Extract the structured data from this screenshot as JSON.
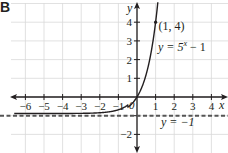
{
  "panel_label": "B",
  "chart_data": {
    "type": "line",
    "title": "",
    "xlabel": "x",
    "ylabel": "y",
    "xlim": [
      -6.5,
      4.7
    ],
    "ylim": [
      -2.6,
      5.1
    ],
    "grid": true,
    "x_ticks": [
      -6,
      -5,
      -4,
      -3,
      -2,
      -1,
      1,
      2,
      3,
      4
    ],
    "x_tick_labels": [
      "−6",
      "−5",
      "−4",
      "−3",
      "−2",
      "−1",
      "1",
      "2",
      "3",
      "4"
    ],
    "y_ticks": [
      -2,
      -1,
      1,
      2,
      3,
      4
    ],
    "y_tick_labels": [
      "−2",
      "",
      "1",
      "2",
      "3",
      "4"
    ],
    "origin_label": "0",
    "series": [
      {
        "name": "y = 5^x − 1",
        "function": "5^x - 1",
        "style": "solid",
        "x": [
          -6.5,
          -6,
          -5,
          -4,
          -3,
          -2,
          -1,
          -0.5,
          0,
          0.5,
          1,
          1.1
        ],
        "y": [
          -1.0,
          -1.0,
          -0.9997,
          -0.9984,
          -0.992,
          -0.96,
          -0.8,
          -0.553,
          0,
          1.236,
          4,
          4.875
        ]
      },
      {
        "name": "y = −1",
        "function": "-1",
        "style": "dashed",
        "x": [
          -6.5,
          4.7
        ],
        "y": [
          -1,
          -1
        ]
      }
    ],
    "annotations": [
      {
        "text": "(1, 4)",
        "x": 1,
        "y": 4,
        "type": "point"
      },
      {
        "text": "y = 5",
        "superscript": "x",
        "suffix": " − 1",
        "label_for": "curve"
      },
      {
        "text": "y = −1",
        "label_for": "asymptote"
      }
    ],
    "colors": {
      "grid": "#d9d9d9",
      "axis": "#231f20",
      "curve": "#231f20",
      "asymptote": "#555555"
    }
  },
  "labels": {
    "point": "(1, 4)",
    "curve_prefix": "y = 5",
    "curve_sup": "x",
    "curve_suffix": " − 1",
    "asymptote": "y = −1",
    "x_axis": "x",
    "y_axis": "y",
    "origin": "0"
  }
}
